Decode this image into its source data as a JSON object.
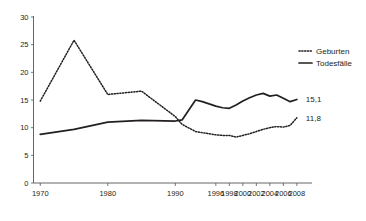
{
  "chart_data": {
    "type": "line",
    "title": "",
    "subtitle": "",
    "xlabel": "",
    "ylabel": "",
    "xlim": [
      1970,
      2008
    ],
    "ylim": [
      0,
      30
    ],
    "yticks": [
      0,
      5,
      10,
      15,
      20,
      25,
      30
    ],
    "xticks": [
      1970,
      1980,
      1990,
      1996,
      1998,
      2000,
      2002,
      2004,
      2006,
      2008
    ],
    "xtick_labels": [
      "1970",
      "1980",
      "1990",
      "1996",
      "1998",
      "2000",
      "2002",
      "2004",
      "2006",
      "2008"
    ],
    "ytick_labels": [
      "0",
      "5",
      "10",
      "15",
      "20",
      "25",
      "30"
    ],
    "grid": false,
    "legend_position": "top-right",
    "series": [
      {
        "name": "Geburten",
        "style": "dotted",
        "color": "#231f20",
        "x": [
          1970,
          1975,
          1980,
          1985,
          1990,
          1991,
          1993,
          1994,
          1995,
          1996,
          1997,
          1998,
          1999,
          2000,
          2001,
          2002,
          2003,
          2004,
          2005,
          2006,
          2007,
          2008
        ],
        "values": [
          14.8,
          25.8,
          16.0,
          16.6,
          12.0,
          10.6,
          9.3,
          9.1,
          8.9,
          8.7,
          8.6,
          8.6,
          8.3,
          8.6,
          8.9,
          9.3,
          9.7,
          10.0,
          10.2,
          10.1,
          10.4,
          11.8
        ],
        "end_label": "11,8"
      },
      {
        "name": "Todesfälle",
        "style": "solid",
        "color": "#231f20",
        "x": [
          1970,
          1975,
          1980,
          1985,
          1990,
          1991,
          1993,
          1994,
          1995,
          1996,
          1997,
          1998,
          1999,
          2000,
          2001,
          2002,
          2003,
          2004,
          2005,
          2006,
          2007,
          2008
        ],
        "values": [
          8.8,
          9.7,
          11.0,
          11.3,
          11.2,
          11.4,
          15.0,
          14.7,
          14.3,
          13.9,
          13.6,
          13.5,
          14.1,
          14.8,
          15.4,
          15.9,
          16.2,
          15.7,
          15.9,
          15.3,
          14.7,
          15.1
        ],
        "end_label": "15,1"
      }
    ],
    "annotations": [
      {
        "text": "15,1",
        "series": "Todesfälle",
        "at_x": 2008,
        "at_y": 15.1
      },
      {
        "text": "11,8",
        "series": "Geburten",
        "at_x": 2008,
        "at_y": 11.8
      }
    ]
  },
  "legend": {
    "items": [
      {
        "label": "Geburten",
        "swatch": "dotted-line-swatch"
      },
      {
        "label": "Todesfälle",
        "swatch": "solid-line-swatch"
      }
    ]
  },
  "colors": {
    "ink": "#231f20",
    "axis": "#555555",
    "background": "#ffffff"
  }
}
